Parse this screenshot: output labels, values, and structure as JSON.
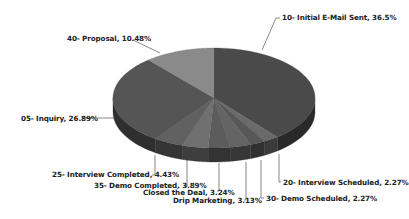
{
  "chart_data": {
    "type": "pie",
    "style": "3d",
    "title": "",
    "start_angle_deg": 90,
    "direction": "clockwise",
    "slices": [
      {
        "label": "10- Initial E-Mail Sent",
        "value": 36.5,
        "text": "10- Initial E-Mail Sent, 36.5%",
        "color": "#4a4a4a"
      },
      {
        "label": "20- Interview Scheduled",
        "value": 2.27,
        "text": "20- Interview Scheduled, 2.27%",
        "color": "#6a6a6a"
      },
      {
        "label": "30- Demo Scheduled",
        "value": 2.27,
        "text": "30- Demo Scheduled, 2.27%",
        "color": "#575757"
      },
      {
        "label": "Drip Marketing",
        "value": 3.13,
        "text": "Drip Marketing, 3.13%",
        "color": "#646464"
      },
      {
        "label": "Closed the Deal",
        "value": 3.24,
        "text": "Closed the Deal, 3.24%",
        "color": "#5c5c5c"
      },
      {
        "label": "35- Demo Completed",
        "value": 3.89,
        "text": "35- Demo Completed, 3.89%",
        "color": "#707070"
      },
      {
        "label": "25- Interview Completed",
        "value": 4.43,
        "text": "25- Interview Completed, 4.43%",
        "color": "#616161"
      },
      {
        "label": "05- Inquiry",
        "value": 26.89,
        "text": "05- Inquiry, 26.89%",
        "color": "#555555"
      },
      {
        "label": "40- Proposal",
        "value": 10.48,
        "text": "40- Proposal, 10.48%",
        "color": "#8a8a8a"
      }
    ],
    "legend": "none",
    "data_labels": "outside with leader lines"
  },
  "labels": {
    "initial_email": "10- Initial E-Mail Sent, 36.5%",
    "proposal": "40- Proposal, 10.48%",
    "inquiry": "05- Inquiry, 26.89%",
    "interview_completed": "25- Interview Completed, 4.43%",
    "demo_completed": "35- Demo Completed, 3.89%",
    "closed_deal": "Closed the Deal, 3.24%",
    "drip_marketing": "Drip Marketing, 3.13%",
    "interview_scheduled": "20- Interview Scheduled, 2.27%",
    "demo_scheduled": "30- Demo Scheduled, 2.27%"
  }
}
